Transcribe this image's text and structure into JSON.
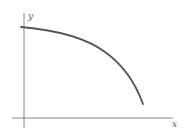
{
  "diagram": {
    "type": "function-plot",
    "axes": {
      "x_label": "x",
      "y_label": "y"
    },
    "curve": {
      "description": "decreasing concave-down curve",
      "color": "#555555"
    },
    "colors": {
      "axis": "#777777",
      "curve": "#555555",
      "background": "#ffffff"
    }
  }
}
